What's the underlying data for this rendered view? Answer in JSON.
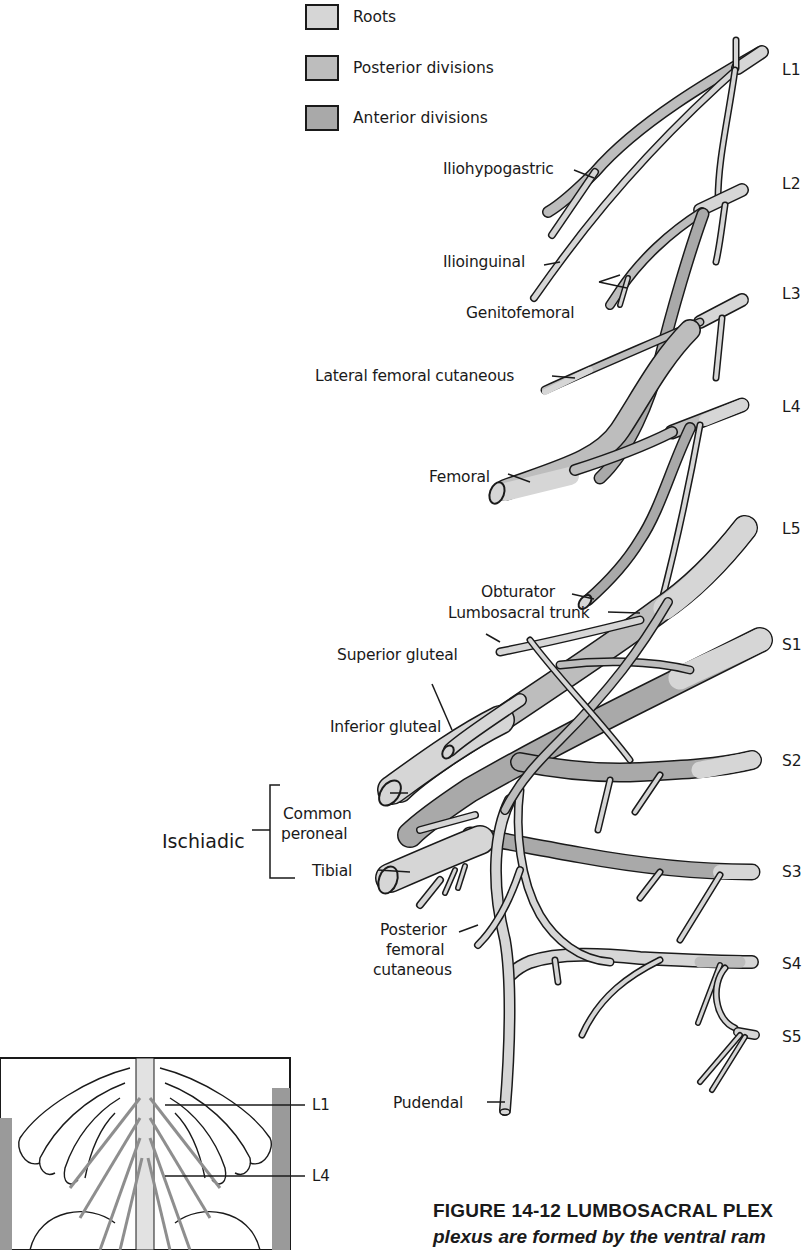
{
  "legend": {
    "items": [
      {
        "label": "Roots",
        "color": "#d6d6d6"
      },
      {
        "label": "Posterior divisions",
        "color": "#bdbdbd"
      },
      {
        "label": "Anterior divisions",
        "color": "#a9a9a9"
      }
    ]
  },
  "segments": {
    "L1": "L1",
    "L2": "L2",
    "L3": "L3",
    "L4": "L4",
    "L5": "L5",
    "S1": "S1",
    "S2": "S2",
    "S3": "S3",
    "S4": "S4",
    "S5": "S5"
  },
  "nerves": {
    "iliohypogastric": "Iliohypogastric",
    "ilioinguinal": "Ilioinguinal",
    "genitofemoral": "Genitofemoral",
    "lateral_femoral_cutaneous": "Lateral femoral cutaneous",
    "femoral": "Femoral",
    "obturator": "Obturator",
    "lumbosacral_trunk": "Lumbosacral trunk",
    "superior_gluteal": "Superior gluteal",
    "inferior_gluteal": "Inferior gluteal",
    "common_peroneal_line1": "Common",
    "common_peroneal_line2": "peroneal",
    "tibial": "Tibial",
    "ischiadic": "Ischiadic",
    "posterior_femoral_cutaneous_line1": "Posterior",
    "posterior_femoral_cutaneous_line2": "femoral",
    "posterior_femoral_cutaneous_line3": "cutaneous",
    "pudendal": "Pudendal"
  },
  "inset": {
    "labels": {
      "L1": "L1",
      "L4": "L4"
    }
  },
  "caption": {
    "title": "FIGURE 14-12 LUMBOSACRAL PLEX",
    "subtitle": "plexus are formed by the ventral ram"
  },
  "colors": {
    "root": "#d6d6d6",
    "posterior": "#bdbdbd",
    "anterior": "#a9a9a9",
    "outline": "#1a1a1a"
  }
}
